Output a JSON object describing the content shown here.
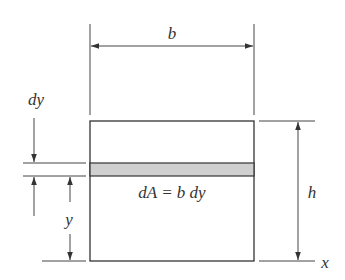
{
  "diagram": {
    "labels": {
      "width": "b",
      "height": "h",
      "strip_thickness": "dy",
      "strip_distance": "y",
      "axis": "x",
      "area_element": "dA = b dy"
    },
    "colors": {
      "line": "#333333",
      "strip_fill": "#cfcfcf",
      "background": "#ffffff"
    }
  }
}
